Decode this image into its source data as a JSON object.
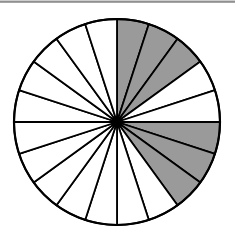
{
  "diagram": {
    "type": "fraction-circle",
    "total_sectors": 20,
    "shaded_sectors": [
      0,
      1,
      2,
      5,
      6,
      7
    ],
    "shaded_count": 6,
    "start_angle_deg": -90,
    "direction": "clockwise",
    "center": [
      117,
      122
    ],
    "radius": 103,
    "colors": {
      "shade": "#9a9a9a",
      "unshaded": "#ffffff",
      "stroke": "#000000",
      "top_rule": "#8a8a8a"
    }
  }
}
